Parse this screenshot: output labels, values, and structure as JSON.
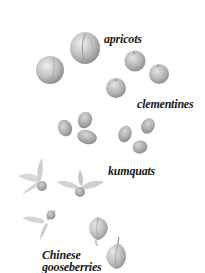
{
  "illustration": {
    "style": "grayscale",
    "colors": {
      "background": "#ffffff",
      "label_text": "#1a1a1a",
      "fruit_fill": "#bdbdbd",
      "fruit_shade": "#8c8c8c"
    },
    "groups": [
      {
        "id": "apricots",
        "label": "apricots",
        "count": 2
      },
      {
        "id": "clementines",
        "label": "clementines",
        "count": 3
      },
      {
        "id": "kumquats",
        "label": "kumquats",
        "count": 6
      },
      {
        "id": "chinese-gooseberries",
        "label_line1": "Chinese",
        "label_line2": "gooseberries",
        "count": 5
      }
    ]
  }
}
